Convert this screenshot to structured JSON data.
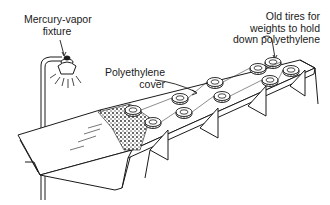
{
  "diagram": {
    "labels": {
      "lamp": [
        "Mercury-vapor",
        "fixture"
      ],
      "tires": [
        "Old tires for",
        "weights to hold",
        "down polyethylene"
      ],
      "cover": [
        "Polyethylene",
        "cover"
      ]
    },
    "colors": {
      "line": "#1a1a1a",
      "background": "#ffffff"
    }
  }
}
